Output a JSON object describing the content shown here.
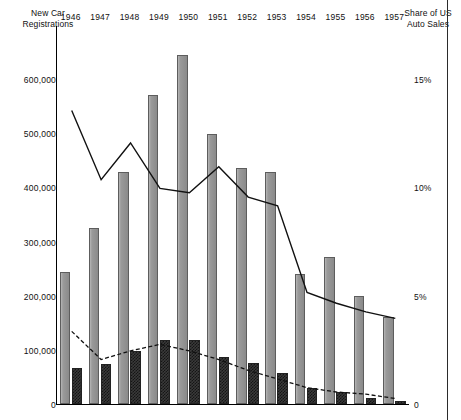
{
  "chart_data": {
    "type": "bar",
    "title": "",
    "subtitle": "",
    "left_axis_title": "New Car\nRegistrations",
    "right_axis_title": "Share of US\nAuto Sales",
    "xlabel": "",
    "categories": [
      "1946",
      "1947",
      "1948",
      "1949",
      "1950",
      "1951",
      "1952",
      "1953",
      "1954",
      "1955",
      "1956",
      "1957"
    ],
    "left_ylabel": "New Car Registrations",
    "right_ylabel": "Share of US Auto Sales",
    "ylim": [
      0,
      700000
    ],
    "left_ticks": [
      "600,000",
      "500,000",
      "400,000",
      "300,000",
      "200,000",
      "100,000",
      "0"
    ],
    "left_tick_values": [
      600000,
      500000,
      400000,
      300000,
      200000,
      100000,
      0
    ],
    "right_ticks": [
      "15%",
      "10%",
      "5%",
      "0"
    ],
    "right_tick_values": [
      15,
      10,
      5,
      0
    ],
    "right_ylim": [
      0,
      17.5
    ],
    "grid": false,
    "legend": "none",
    "series": [
      {
        "name": "New Car Registrations (light gray bars)",
        "type": "bar",
        "axis": "left",
        "style": "solid-gray",
        "values": [
          243000,
          325000,
          428000,
          570000,
          645000,
          498000,
          435000,
          428000,
          240000,
          272000,
          200000,
          160000
        ]
      },
      {
        "name": "New Car Registrations (dark crosshatched bars)",
        "type": "bar",
        "axis": "left",
        "style": "crosshatch",
        "values": [
          66000,
          74000,
          98000,
          118000,
          118000,
          86000,
          75000,
          57000,
          30000,
          22000,
          12000,
          6000
        ]
      },
      {
        "name": "Share of US Auto Sales (solid line)",
        "type": "line",
        "axis": "right",
        "style": "solid",
        "values": [
          13.6,
          10.4,
          12.1,
          10.0,
          9.8,
          11.0,
          9.6,
          9.2,
          5.2,
          4.7,
          4.3,
          4.0
        ]
      },
      {
        "name": "Share of US Auto Sales (dashed line)",
        "type": "line",
        "axis": "right",
        "style": "dashed",
        "values": [
          3.4,
          2.1,
          2.5,
          2.8,
          2.5,
          2.1,
          1.6,
          1.2,
          0.8,
          0.6,
          0.5,
          0.3
        ]
      }
    ]
  },
  "layout": {
    "plot_left": 56,
    "plot_top": 26,
    "plot_width": 353,
    "plot_height": 379,
    "baseline_y": 404,
    "units_per_px": 1709
  },
  "colors": {
    "bar_gray": "#8e8e8e",
    "bar_hatch": "#303030",
    "line": "#111111",
    "axis": "#000000",
    "text": "#111111",
    "background": "#ffffff"
  }
}
